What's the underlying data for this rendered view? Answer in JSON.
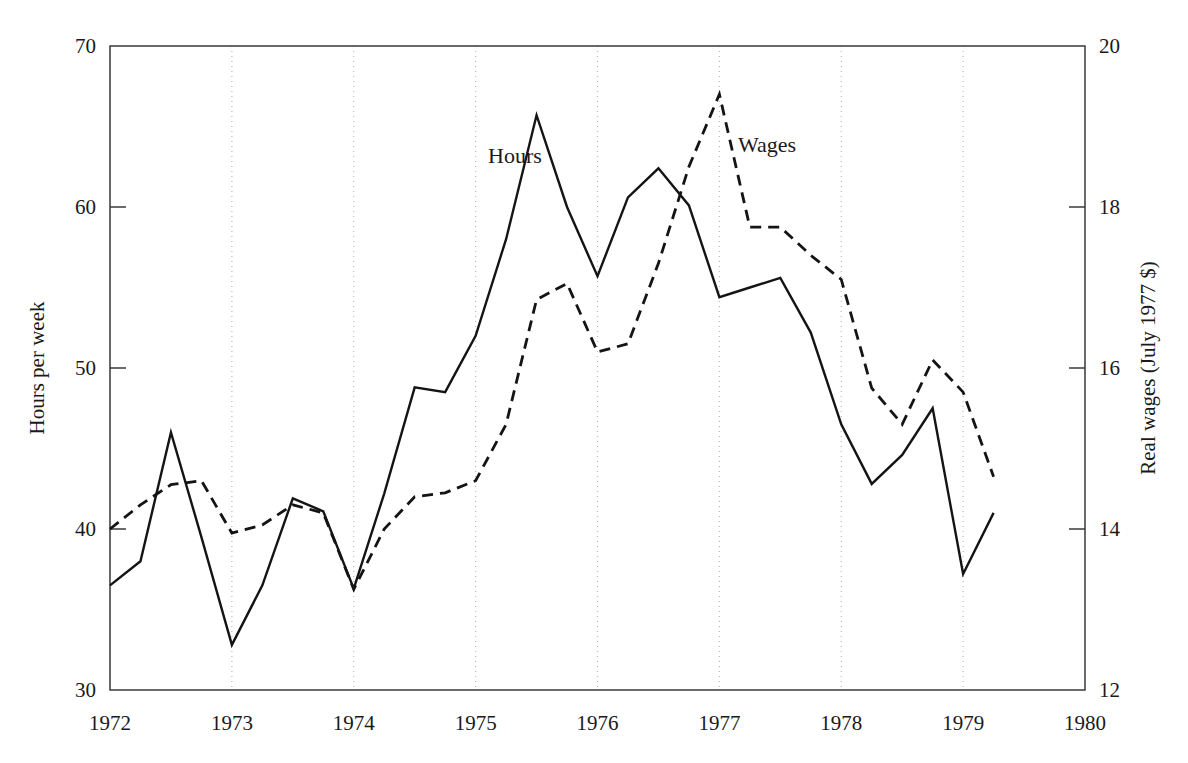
{
  "chart_data": {
    "type": "line",
    "title": "",
    "subtitle": "",
    "xlabel": "",
    "ylabel": "Hours per week",
    "y2label": "Real wages (July 1977 $)",
    "xlim": [
      1972,
      1980
    ],
    "ylim": [
      30,
      70
    ],
    "y2lim": [
      12,
      20
    ],
    "grid": "vertical-dotted-at-year-ticks",
    "legend": "inline-labels",
    "x_ticks": [
      1972,
      1973,
      1974,
      1975,
      1976,
      1977,
      1978,
      1979,
      1980
    ],
    "x_tick_labels": [
      "1972",
      "1973",
      "1974",
      "1975",
      "1976",
      "1977",
      "1978",
      "1979",
      "1980"
    ],
    "y_ticks": [
      30,
      40,
      50,
      60,
      70
    ],
    "y_tick_labels": [
      "30",
      "40",
      "50",
      "60",
      "70"
    ],
    "y2_ticks": [
      12,
      14,
      16,
      18,
      20
    ],
    "y2_tick_labels": [
      "12",
      "14",
      "16",
      "18",
      "20"
    ],
    "series": [
      {
        "name": "Hours",
        "label": "Hours",
        "axis": "left",
        "style": "solid",
        "color": "#141414",
        "x": [
          1972.0,
          1972.25,
          1972.5,
          1972.75,
          1973.0,
          1973.25,
          1973.5,
          1973.75,
          1974.0,
          1974.25,
          1974.5,
          1974.75,
          1975.0,
          1975.25,
          1975.5,
          1975.75,
          1976.0,
          1976.25,
          1976.5,
          1976.75,
          1977.0,
          1977.25,
          1977.5,
          1977.75,
          1978.0,
          1978.25,
          1978.5,
          1978.75,
          1979.0,
          1979.25
        ],
        "values": [
          36.5,
          38.0,
          46.0,
          39.5,
          32.8,
          36.5,
          41.9,
          41.1,
          36.3,
          42.2,
          48.8,
          48.5,
          52.0,
          58.0,
          65.7,
          60.0,
          55.7,
          60.6,
          62.4,
          60.1,
          54.4,
          55.0,
          55.6,
          52.2,
          46.5,
          42.8,
          44.6,
          47.5,
          37.2,
          41.0
        ]
      },
      {
        "name": "Wages",
        "label": "Wages",
        "axis": "right",
        "style": "dashed",
        "color": "#141414",
        "x": [
          1972.0,
          1972.25,
          1972.5,
          1972.75,
          1973.0,
          1973.25,
          1973.5,
          1973.75,
          1974.0,
          1974.25,
          1974.5,
          1974.75,
          1975.0,
          1975.25,
          1975.5,
          1975.75,
          1976.0,
          1976.25,
          1976.5,
          1976.75,
          1977.0,
          1977.25,
          1977.5,
          1977.75,
          1978.0,
          1978.25,
          1978.5,
          1978.75,
          1979.0,
          1979.25
        ],
        "values": [
          14.0,
          14.3,
          14.55,
          14.6,
          13.95,
          14.05,
          14.3,
          14.2,
          13.25,
          14.0,
          14.4,
          14.45,
          14.6,
          15.3,
          16.85,
          17.05,
          16.2,
          16.3,
          17.3,
          18.5,
          19.4,
          17.75,
          17.75,
          17.4,
          17.1,
          15.75,
          15.3,
          16.1,
          15.7,
          14.65
        ]
      }
    ],
    "annotations": [
      {
        "text": "Hours",
        "x": 1975.05,
        "y": 61.6,
        "series": "Hours"
      },
      {
        "text": "Wages",
        "x": 1977.2,
        "y": 62.2,
        "series": "Wages"
      }
    ]
  }
}
